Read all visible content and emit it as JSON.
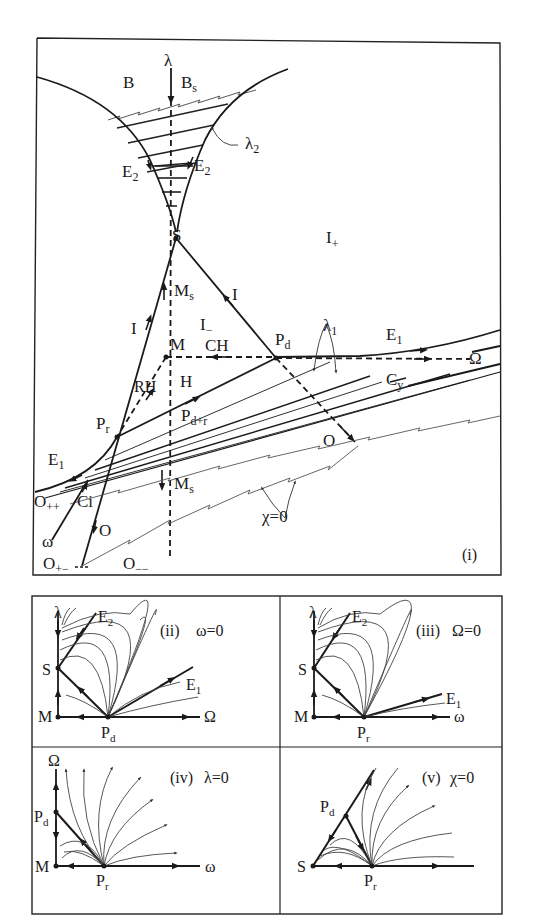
{
  "panel_i": {
    "tag": "(i)",
    "labels": {
      "lambda": "λ",
      "B": "B",
      "Bs": "B",
      "Bs_sub": "s",
      "lambda2": "λ",
      "lambda2_sub": "2",
      "E2_left": "E",
      "E2_left_sub": "2",
      "E2_right": "E",
      "E2_right_sub": "2",
      "S": "S",
      "I_plus": "I",
      "I_plus_sub": "+",
      "Ms_top": "M",
      "Ms_top_sub": "s",
      "I_right": "I",
      "I_left": "I",
      "I_minus": "I",
      "I_minus_sub": "−",
      "M": "M",
      "CH": "CH",
      "Pd": "P",
      "Pd_sub": "d",
      "lambda1": "λ",
      "lambda1_sub": "1",
      "E1_right": "E",
      "E1_right_sub": "1",
      "Omega": "Ω",
      "RH": "RH",
      "H": "H",
      "Cy": "C",
      "Cy_sub": "y",
      "Pr": "P",
      "Pr_sub": "r",
      "Pdr": "P",
      "Pdr_sub": "d+r",
      "O_right": "O",
      "E1_left": "E",
      "E1_left_sub": "1",
      "Opp": "O",
      "Opp_sub": "++",
      "Ci": "Ci",
      "Ms_bottom": "M",
      "Ms_bottom_sub": "s",
      "chi0": "χ=0",
      "omega": "ω",
      "O_left": "O",
      "Op": "O",
      "Op_sub": "+−",
      "Omm": "O",
      "Omm_sub": "−−"
    }
  },
  "panel_ii": {
    "tag": "(ii)",
    "condition": "ω=0",
    "labels": {
      "lambda": "λ",
      "E2": "E",
      "E2_sub": "2",
      "S": "S",
      "E1": "E",
      "E1_sub": "1",
      "M": "M",
      "Pd": "P",
      "Pd_sub": "d",
      "axis": "Ω"
    }
  },
  "panel_iii": {
    "tag": "(iii)",
    "condition": "Ω=0",
    "labels": {
      "lambda": "λ",
      "E2": "E",
      "E2_sub": "2",
      "S": "S",
      "E1": "E",
      "E1_sub": "1",
      "M": "M",
      "Pr": "P",
      "Pr_sub": "r",
      "axis": "ω"
    }
  },
  "panel_iv": {
    "tag": "(iv)",
    "condition": "λ=0",
    "labels": {
      "Omega": "Ω",
      "Pd": "P",
      "Pd_sub": "d",
      "M": "M",
      "Pr": "P",
      "Pr_sub": "r",
      "axis": "ω"
    }
  },
  "panel_v": {
    "tag": "(v)",
    "condition": "χ=0",
    "labels": {
      "Pd": "P",
      "Pd_sub": "d",
      "S": "S",
      "Pr": "P",
      "Pr_sub": "r"
    }
  }
}
